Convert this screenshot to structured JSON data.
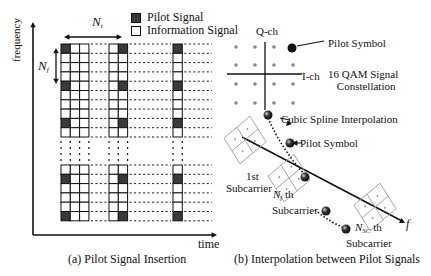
{
  "colors": {
    "line": "#111111",
    "pilot": "#3a3a3a",
    "dot": "#888888",
    "bg": "#ffffff"
  },
  "legend": {
    "pilot_label": "Pilot Signal",
    "info_label": "Information Signal"
  },
  "panel_a": {
    "caption": "(a) Pilot Signal Insertion",
    "x_axis_label": "time",
    "y_axis_label": "frequency",
    "nt_label": "N",
    "nt_sub": "t",
    "nf_label": "N",
    "nf_sub": "f",
    "cell_size": 9.3,
    "blocks": [
      {
        "x": 61,
        "cols": 3,
        "pilot_col": 0
      },
      {
        "x": 109,
        "cols": 2,
        "pilot_col": 1
      },
      {
        "x": 173,
        "cols": 1,
        "pilot_col": 0
      }
    ],
    "top_rows": {
      "y": 44,
      "rows": 10,
      "pilot_rows": [
        0,
        4,
        8
      ]
    },
    "bottom_rows": {
      "y": 165,
      "rows": 6,
      "pilot_rows": [
        1,
        5
      ]
    }
  },
  "panel_b": {
    "caption": "(b) Interpolation between Pilot Signals",
    "q_axis_label": "Q-ch",
    "i_axis_label": "I-ch",
    "constellation_label_line1": "16 QAM Signal",
    "constellation_label_line2": "Constellation",
    "pilot_symbol_label": "Pilot Symbol",
    "spline_label": "Cubic Spline Interpolation",
    "pilot_symbol_label2": "Pilot Symbol",
    "first_sub_line1": "1st",
    "first_sub_line2": "Subcarrier",
    "nf_label": "N",
    "nf_sub": "f",
    "nf_suffix": " th",
    "nf_sub_line2": "Subcarrier",
    "nsc_label": "N",
    "nsc_sub": "SC",
    "nsc_suffix": " th",
    "nsc_sub_line2": "Subcarrier",
    "f_axis_label": "f"
  }
}
